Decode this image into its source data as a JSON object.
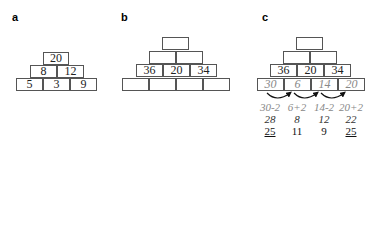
{
  "panels": {
    "a": {
      "label": "a",
      "rows": [
        [
          "20"
        ],
        [
          "8",
          "12"
        ],
        [
          "5",
          "3",
          "9"
        ]
      ]
    },
    "b": {
      "label": "b",
      "rows": [
        [
          ""
        ],
        [
          "",
          ""
        ],
        [
          "36",
          "20",
          "34"
        ],
        [
          "",
          "",
          "",
          ""
        ]
      ]
    },
    "c": {
      "label": "c",
      "rows": [
        [
          ""
        ],
        [
          "",
          ""
        ],
        [
          "36",
          "20",
          "34"
        ],
        [
          "30",
          "6",
          "14",
          "20"
        ]
      ],
      "expressions": [
        "30-2",
        "6+2",
        "14-2",
        "20+2"
      ],
      "intermediate": [
        "28",
        "8",
        "12",
        "22"
      ],
      "final": [
        "25",
        "11",
        "9",
        "25"
      ],
      "underlined_final": [
        true,
        false,
        false,
        true
      ]
    }
  },
  "colors": {
    "box_border": "#555555",
    "italic_gray": "#888888",
    "text": "#222222"
  }
}
